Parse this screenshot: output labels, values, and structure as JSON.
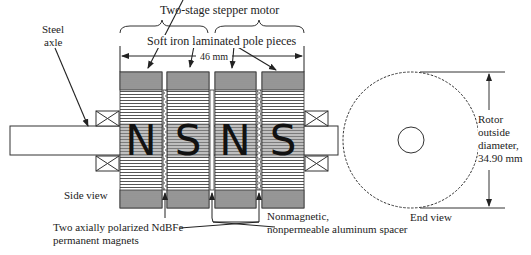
{
  "title": "Two-stage stepper motor",
  "labels": {
    "steel_axle_line1": "Steel",
    "steel_axle_line2": "axle",
    "pole_pieces": "Soft iron laminated pole pieces",
    "length_dim": "46 mm",
    "side_view": "Side view",
    "end_view": "End view",
    "magnets_line1": "Two axially polarized NdBFe",
    "magnets_line2": "permanent magnets",
    "spacer_line1": "Nonmagnetic,",
    "spacer_line2": "nonpermeable aluminum spacer",
    "rotor_line1": "Rotor",
    "rotor_line2": "outside",
    "rotor_line3": "diameter,",
    "rotor_line4": "34.90 mm"
  },
  "poles": [
    "N",
    "S",
    "N",
    "S"
  ],
  "colors": {
    "stroke": "#222222",
    "hatch": "#444444",
    "background": "#ffffff"
  }
}
